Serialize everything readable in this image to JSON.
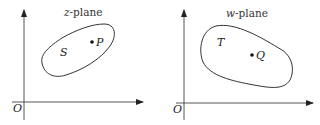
{
  "diagram": {
    "left_panel": {
      "title_var": "z",
      "title_suffix": "-plane",
      "origin_label": "O",
      "region_label": "S",
      "point_label": "P"
    },
    "right_panel": {
      "title_var": "w",
      "title_suffix": "-plane",
      "origin_label": "O",
      "region_label": "T",
      "point_label": "Q"
    },
    "colors": {
      "stroke": "#333333",
      "background": "#ffffff"
    }
  }
}
